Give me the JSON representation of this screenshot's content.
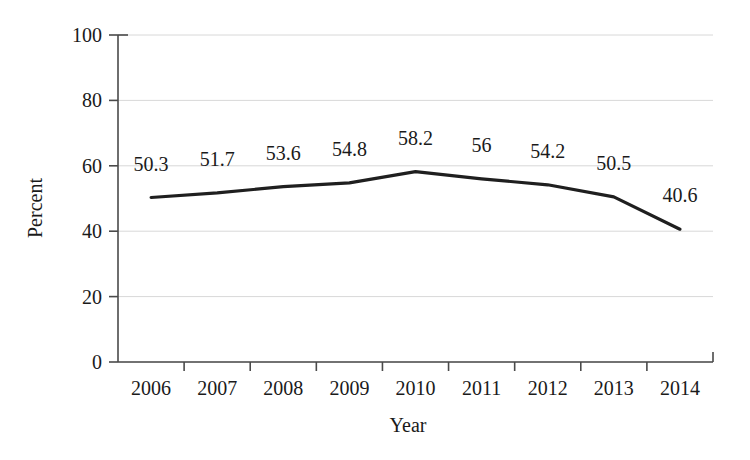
{
  "chart_data": {
    "type": "line",
    "title": "",
    "subtitle": "",
    "xlabel": "Year",
    "ylabel": "Percent",
    "categories": [
      "2006",
      "2007",
      "2008",
      "2009",
      "2010",
      "2011",
      "2012",
      "2013",
      "2014"
    ],
    "values": [
      50.3,
      51.7,
      53.6,
      54.8,
      58.2,
      56,
      54.2,
      50.5,
      40.6
    ],
    "point_labels": [
      "50.3",
      "51.7",
      "53.6",
      "54.8",
      "58.2",
      "56",
      "54.2",
      "50.5",
      "40.6"
    ],
    "series": [
      {
        "name": "Percent",
        "values": [
          50.3,
          51.7,
          53.6,
          54.8,
          58.2,
          56,
          54.2,
          50.5,
          40.6
        ]
      }
    ],
    "ylim": [
      0,
      100
    ],
    "yticks": [
      0,
      20,
      40,
      60,
      80,
      100
    ],
    "ytick_labels": [
      "0",
      "20",
      "40",
      "60",
      "80",
      "100"
    ],
    "xtick_labels": [
      "2006",
      "2007",
      "2008",
      "2009",
      "2010",
      "2011",
      "2012",
      "2013",
      "2014"
    ],
    "grid": true,
    "grid_axis": "y",
    "legend": false,
    "legend_position": "none",
    "annotations": [],
    "colors": {
      "background": "#ffffff",
      "line": "#1f1f1f",
      "axis": "#4a4a4a",
      "grid": "#d8d8d8",
      "text": "#1a1a1a"
    }
  }
}
